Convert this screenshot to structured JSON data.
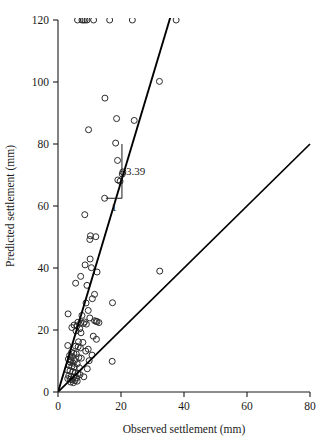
{
  "chart_data": {
    "type": "scatter",
    "title": "",
    "xlabel": "Observed settlement (mm)",
    "ylabel": "Predicted settlement (mm)",
    "xlim": [
      0,
      80
    ],
    "ylim": [
      0,
      120
    ],
    "xticks": [
      0,
      20,
      40,
      60,
      80
    ],
    "yticks": [
      0,
      20,
      40,
      60,
      80,
      100,
      120
    ],
    "xtick_labels": [
      "0",
      "20",
      "40",
      "60",
      "80"
    ],
    "ytick_labels": [
      "0",
      "20",
      "40",
      "60",
      "80",
      "100",
      "120"
    ],
    "grid": false,
    "legend": false,
    "marker": "open-circle",
    "annotations": [
      {
        "name": "slope-rise-label",
        "text": "3.39",
        "x": 24.5,
        "y": 73.5
      },
      {
        "name": "slope-run-label",
        "text": "1",
        "x": 20.8,
        "y": 59.5
      }
    ],
    "lines": [
      {
        "name": "regression-line",
        "label": "",
        "slope": 3.39,
        "intercept": 0,
        "x_start": 0,
        "y_start": 0,
        "x_end": 38.0,
        "y_end": 128.8
      },
      {
        "name": "unity-line",
        "label": "",
        "slope": 1,
        "intercept": 0,
        "x_start": 0,
        "y_start": 0,
        "x_end": 80,
        "y_end": 80
      }
    ],
    "slope_triangle": {
      "apex_x": 20.3,
      "apex_y": 80.0,
      "corner_x": 20.3,
      "corner_y": 62.5,
      "base_x": 15.2,
      "base_y": 62.5,
      "rise_text": "3.39",
      "run_text": "1"
    },
    "series": [
      {
        "name": "settlement-observations",
        "points": [
          [
            6.2,
            120
          ],
          [
            7.6,
            120
          ],
          [
            8.1,
            120
          ],
          [
            8.6,
            120
          ],
          [
            9.2,
            120
          ],
          [
            11.3,
            120
          ],
          [
            16.4,
            120
          ],
          [
            23.6,
            120
          ],
          [
            37.5,
            120
          ],
          [
            32.2,
            100.2
          ],
          [
            14.9,
            94.8
          ],
          [
            18.6,
            88.2
          ],
          [
            24.2,
            87.6
          ],
          [
            9.7,
            84.6
          ],
          [
            18.3,
            80.3
          ],
          [
            18.9,
            74.7
          ],
          [
            20.6,
            71.0
          ],
          [
            20.4,
            70.3
          ],
          [
            19.0,
            68.4
          ],
          [
            19.7,
            68.0
          ],
          [
            14.8,
            62.5
          ],
          [
            8.5,
            57.2
          ],
          [
            10.3,
            50.4
          ],
          [
            12.0,
            50.1
          ],
          [
            10.1,
            49.2
          ],
          [
            10.2,
            42.9
          ],
          [
            8.6,
            41.0
          ],
          [
            10.6,
            40.1
          ],
          [
            12.4,
            38.7
          ],
          [
            32.3,
            39.0
          ],
          [
            7.2,
            37.3
          ],
          [
            5.6,
            35.1
          ],
          [
            9.2,
            34.4
          ],
          [
            11.6,
            31.5
          ],
          [
            10.9,
            30.1
          ],
          [
            8.9,
            28.7
          ],
          [
            17.3,
            28.8
          ],
          [
            9.6,
            26.3
          ],
          [
            3.2,
            25.2
          ],
          [
            7.6,
            24.7
          ],
          [
            10.1,
            23.9
          ],
          [
            11.6,
            23.0
          ],
          [
            12.1,
            22.8
          ],
          [
            12.4,
            22.7
          ],
          [
            6.3,
            22.5
          ],
          [
            7.2,
            22.3
          ],
          [
            8.1,
            22.1
          ],
          [
            9.0,
            21.9
          ],
          [
            5.1,
            21.6
          ],
          [
            6.0,
            21.3
          ],
          [
            4.4,
            20.8
          ],
          [
            6.9,
            20.4
          ],
          [
            5.7,
            19.7
          ],
          [
            7.3,
            19.1
          ],
          [
            11.2,
            18.0
          ],
          [
            12.2,
            17.0
          ],
          [
            3.1,
            15.0
          ],
          [
            5.6,
            14.8
          ],
          [
            6.4,
            14.6
          ],
          [
            7.1,
            14.2
          ],
          [
            9.6,
            13.8
          ],
          [
            8.8,
            13.2
          ],
          [
            4.3,
            12.8
          ],
          [
            5.0,
            12.5
          ],
          [
            5.8,
            12.3
          ],
          [
            3.7,
            11.8
          ],
          [
            4.6,
            11.4
          ],
          [
            6.6,
            11.1
          ],
          [
            7.4,
            10.9
          ],
          [
            3.3,
            10.6
          ],
          [
            4.1,
            10.4
          ],
          [
            5.3,
            10.2
          ],
          [
            9.9,
            10.1
          ],
          [
            17.2,
            9.9
          ],
          [
            3.9,
            9.6
          ],
          [
            4.8,
            9.3
          ],
          [
            6.1,
            9.1
          ],
          [
            3.5,
            8.6
          ],
          [
            4.4,
            8.3
          ],
          [
            5.2,
            8.1
          ],
          [
            6.8,
            7.8
          ],
          [
            9.3,
            7.5
          ],
          [
            3.0,
            7.1
          ],
          [
            3.8,
            6.8
          ],
          [
            4.7,
            6.5
          ],
          [
            5.5,
            6.2
          ],
          [
            6.3,
            5.9
          ],
          [
            7.0,
            5.6
          ],
          [
            3.4,
            5.2
          ],
          [
            4.2,
            5.0
          ],
          [
            5.0,
            4.8
          ],
          [
            5.9,
            4.6
          ],
          [
            8.2,
            4.9
          ],
          [
            3.1,
            4.3
          ],
          [
            3.9,
            4.1
          ],
          [
            4.6,
            3.9
          ],
          [
            5.4,
            3.7
          ],
          [
            6.1,
            3.5
          ],
          [
            4.0,
            3.2
          ],
          [
            4.9,
            3.0
          ],
          [
            6.5,
            16.2
          ],
          [
            7.9,
            16.0
          ],
          [
            8.4,
            22.6
          ],
          [
            13.0,
            22.4
          ],
          [
            10.8,
            11.9
          ]
        ]
      }
    ]
  },
  "axes": {
    "x_axis_name": "x-axis",
    "y_axis_name": "y-axis"
  }
}
